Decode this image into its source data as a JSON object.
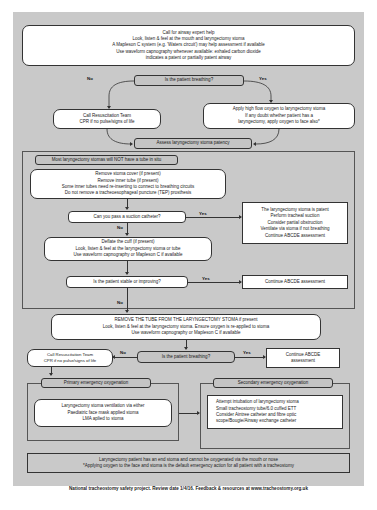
{
  "poster": {
    "title": "Emergency laryngectomy management",
    "footer_note_lines": [
      "Laryngectomy patient has an end stoma and cannot be oxygenated via the mouth or nose",
      "*Applying oxygen to the face and stoma is the default emergency action for all patient with a tracheostomy"
    ],
    "credit": "National tracheostomy safety project. Review date 1/4/16. Feedback & resources at www.tracheostomy.org.uk"
  },
  "intro": {
    "lines": [
      "Call for airway expert help",
      "Look, listen & feel at the mouth and laryngectomy stoma",
      "A Mapleson C system (e.g. 'Waters circuit') may help assessment if available",
      "Use waveform capnography whenever available: exhaled carbon dioxide",
      "indicates a patent or partially patent airway"
    ]
  },
  "decision1": {
    "question": "Is the patient breathing?",
    "no_label": "No",
    "yes_label": "Yes"
  },
  "resus1": {
    "lines": [
      "Call Resuscitation Team",
      "CPR if no pulse/signs of life"
    ]
  },
  "oxygen": {
    "lines": [
      "Apply high flow oxygen to laryngectomy stoma",
      "If any doubt whether patient has a",
      "laryngectomy, apply oxygen to face also*"
    ]
  },
  "assess": {
    "title": "Assess laryngectomy stoma patency",
    "subheading": "Most laryngectomy stomas will NOT have a tube in situ"
  },
  "remove": {
    "lines": [
      "Remove stoma cover (if present)",
      "Remove inner tube (if present)",
      "Some inner tubes need re-inserting to connect to breathing circuits",
      "Do not remove a tracheoesophageal puncture (TEP) prosthesis"
    ]
  },
  "decision2": {
    "question": "Can you pass a suction catheter?",
    "yes_label": "Yes",
    "no_label": "No"
  },
  "patent": {
    "lines": [
      "The laryngectomy stoma is patent",
      "Perform tracheal suction",
      "Consider partial obstruction",
      "Ventilate via stoma if not breathing",
      "Continue ABCDE assessment"
    ]
  },
  "deflate": {
    "lines": [
      "Deflate the cuff (if present)",
      "Look, listen & feel at the laryngectomy stoma or tube",
      "Use waveform capnography or Mapleson C if available"
    ]
  },
  "decision3": {
    "question": "Is the patient stable or improving?",
    "yes_label": "Yes",
    "no_label": "No"
  },
  "continue1": {
    "text": "Continue ABCDE assessment"
  },
  "removetube": {
    "lines": [
      "REMOVE THE TUBE FROM THE LARYNGECTOMY STOMA if present",
      "Look, listen & feel at the laryngectomy stoma. Ensure oxygen is re-applied to stoma",
      "Use waveform capnography or Mapleson C if available"
    ]
  },
  "decision4": {
    "question": "Is the patient breathing?",
    "no_label": "No",
    "yes_label": "Yes"
  },
  "resus2": {
    "lines": [
      "Call Resuscitation Team",
      "CPR if no pulse/signs of life"
    ]
  },
  "continue2": {
    "lines": [
      "Continue ABCDE",
      "assessment"
    ]
  },
  "primary": {
    "title": "Primary emergency oxygenation",
    "lines": [
      "Laryngectomy stoma ventilation via either",
      "Paediatric face mask applied stoma",
      "LMA aplied to stoma"
    ]
  },
  "secondary": {
    "title": "Secondary emergency oxygenation",
    "lines": [
      "Attempt intubation of laryngectomy stoma",
      "Small tracheostomy tube/6.0 cuffed ETT",
      "Consider Aintree catheter and fibre optic",
      "scope/Bougie/Airway exchange catheter"
    ]
  },
  "colors": {
    "canvas": "#c9c9c9",
    "box_fill": "#ffffff",
    "decision_fill": "#c4c4c4",
    "line": "#333333"
  }
}
